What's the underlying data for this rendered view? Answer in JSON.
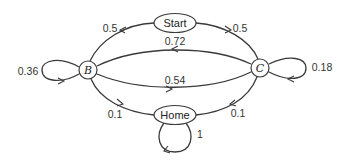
{
  "diagram": {
    "type": "state-transition-diagram",
    "nodes": {
      "start": {
        "label": "Start"
      },
      "b": {
        "label": "B"
      },
      "c": {
        "label": "C"
      },
      "home": {
        "label": "Home"
      }
    },
    "edges": {
      "start_to_b": {
        "from": "Start",
        "to": "B",
        "label": "0.5"
      },
      "start_to_c": {
        "from": "Start",
        "to": "C",
        "label": "0.5"
      },
      "c_to_b": {
        "from": "C",
        "to": "B",
        "label": "0.72"
      },
      "b_to_c": {
        "from": "B",
        "to": "C",
        "label": "0.54"
      },
      "b_to_b": {
        "from": "B",
        "to": "B",
        "label": "0.36"
      },
      "c_to_c": {
        "from": "C",
        "to": "C",
        "label": "0.18"
      },
      "b_to_home": {
        "from": "B",
        "to": "Home",
        "label": "0.1"
      },
      "c_to_home": {
        "from": "C",
        "to": "Home",
        "label": "0.1"
      },
      "home_to_home": {
        "from": "Home",
        "to": "Home",
        "label": "1"
      }
    }
  }
}
